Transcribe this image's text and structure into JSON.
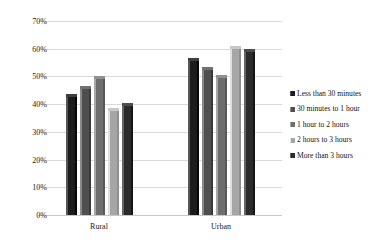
{
  "chart_data": {
    "type": "bar",
    "title": "",
    "subtitle": "",
    "xlabel": "",
    "ylabel": "",
    "categories": [
      "Rural",
      "Urban"
    ],
    "ylim": [
      0,
      70
    ],
    "yticks": [
      "0%",
      "10%",
      "20%",
      "30%",
      "40%",
      "50%",
      "60%",
      "70%"
    ],
    "ytick_values": [
      0,
      10,
      20,
      30,
      40,
      50,
      60,
      70
    ],
    "grid": true,
    "legend_position": "right",
    "value_suffix": "%",
    "series": [
      {
        "name": "Less than 30 minutes",
        "color": "#1c1c1c",
        "values": [
          43.5,
          56.5
        ]
      },
      {
        "name": "30 minutes to 1 hour",
        "color": "#4f4f4f",
        "values": [
          46.5,
          53.5
        ]
      },
      {
        "name": "1 hour to 2 hours",
        "color": "#6e6e6e",
        "values": [
          50.0,
          50.5
        ]
      },
      {
        "name": "2 hours to 3 hours",
        "color": "#a6a6a6",
        "values": [
          38.5,
          61.0
        ]
      },
      {
        "name": "More than 3 hours",
        "color": "#2b2b2b",
        "values": [
          40.5,
          60.0
        ]
      }
    ]
  },
  "axis": {
    "gridline_color": "#d9d9d9",
    "baseline_color": "#c8c8c8"
  },
  "legend": {
    "items": [
      {
        "label": "Less than 30 minutes"
      },
      {
        "label": "30 minutes to 1 hour"
      },
      {
        "label": "1 hour to 2 hours"
      },
      {
        "label": "2 hours to 3 hours"
      },
      {
        "label": "More than 3 hours"
      }
    ]
  }
}
